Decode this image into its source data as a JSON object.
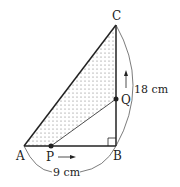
{
  "points": {
    "A": {
      "label": "A",
      "x": 24,
      "y": 146
    },
    "B": {
      "label": "B",
      "x": 116,
      "y": 146
    },
    "C": {
      "label": "C",
      "x": 116,
      "y": 25
    },
    "P": {
      "label": "P",
      "x": 51,
      "y": 146
    },
    "Q": {
      "label": "Q",
      "x": 116,
      "y": 99
    }
  },
  "measurements": {
    "AB": "9 cm",
    "BC": "18 cm"
  },
  "colors": {
    "line": "#222222",
    "shade_dot": "#555555",
    "background": "#ffffff"
  }
}
